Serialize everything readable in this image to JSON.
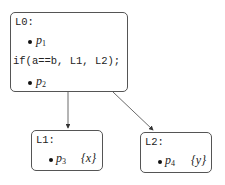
{
  "nodes": [
    {
      "id": "L0",
      "label": "L0:",
      "lines": [
        {
          "type": "point",
          "name": "p",
          "sub": "1"
        },
        {
          "type": "code",
          "text": "if(a==b, L1, L2);"
        },
        {
          "type": "point",
          "name": "p",
          "sub": "2"
        }
      ]
    },
    {
      "id": "L1",
      "label": "L1:",
      "lines": [
        {
          "type": "point",
          "name": "p",
          "sub": "3",
          "set": "{x}"
        }
      ]
    },
    {
      "id": "L2",
      "label": "L2:",
      "lines": [
        {
          "type": "point",
          "name": "p",
          "sub": "4",
          "set": "{y}"
        }
      ]
    }
  ],
  "edges": [
    {
      "from": "L0",
      "to": "L1"
    },
    {
      "from": "L0",
      "to": "L2"
    }
  ],
  "labels": {
    "l0": "L0:",
    "l0_p1": "p",
    "l0_p1_sub": "1",
    "l0_code": "if(a==b, L1, L2);",
    "l0_p2": "p",
    "l0_p2_sub": "2",
    "l1": "L1:",
    "l1_p3": "p",
    "l1_p3_sub": "3",
    "l1_set": "{x}",
    "l2": "L2:",
    "l2_p4": "p",
    "l2_p4_sub": "4",
    "l2_set": "{y}"
  }
}
